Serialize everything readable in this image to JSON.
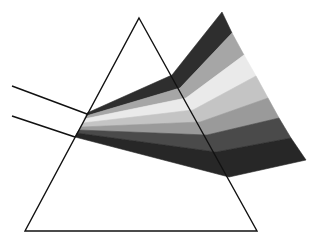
{
  "diagram": {
    "background": "#ffffff",
    "line_color": "#111111",
    "prism": {
      "apex": [
        139,
        18
      ],
      "bottom_left": [
        25,
        231
      ],
      "bottom_right": [
        257,
        231
      ]
    },
    "incoming_rays": [
      {
        "from": [
          12,
          86
        ],
        "to": [
          87,
          114
        ]
      },
      {
        "from": [
          12,
          116
        ],
        "to": [
          75,
          137
        ]
      }
    ],
    "bands": [
      {
        "color": "#2e2e2e",
        "entry": [
          [
            87,
            113
          ],
          [
            86,
            116
          ]
        ],
        "exit": [
          [
            172,
            75
          ],
          [
            180,
            88
          ]
        ],
        "out": [
          [
            222,
            12
          ],
          [
            232,
            33
          ]
        ]
      },
      {
        "color": "#a6a6a6",
        "entry": [
          [
            86,
            116
          ],
          [
            84,
            119
          ]
        ],
        "exit": [
          [
            180,
            88
          ],
          [
            186,
            98
          ]
        ],
        "out": [
          [
            232,
            33
          ],
          [
            244,
            55
          ]
        ]
      },
      {
        "color": "#eaeaea",
        "entry": [
          [
            84,
            119
          ],
          [
            83,
            123
          ]
        ],
        "exit": [
          [
            186,
            98
          ],
          [
            193,
            110
          ]
        ],
        "out": [
          [
            244,
            55
          ],
          [
            256,
            76
          ]
        ]
      },
      {
        "color": "#c4c4c4",
        "entry": [
          [
            83,
            123
          ],
          [
            81,
            127
          ]
        ],
        "exit": [
          [
            193,
            110
          ],
          [
            200,
            122
          ]
        ],
        "out": [
          [
            256,
            76
          ],
          [
            268,
            98
          ]
        ]
      },
      {
        "color": "#9a9a9a",
        "entry": [
          [
            81,
            127
          ],
          [
            79,
            130
          ]
        ],
        "exit": [
          [
            200,
            122
          ],
          [
            207,
            135
          ]
        ],
        "out": [
          [
            268,
            98
          ],
          [
            279,
            118
          ]
        ]
      },
      {
        "color": "#4a4a4a",
        "entry": [
          [
            79,
            130
          ],
          [
            77,
            133
          ]
        ],
        "exit": [
          [
            207,
            135
          ],
          [
            216,
            152
          ]
        ],
        "out": [
          [
            279,
            118
          ],
          [
            291,
            138
          ]
        ]
      },
      {
        "color": "#272727",
        "entry": [
          [
            77,
            133
          ],
          [
            75,
            137
          ]
        ],
        "exit": [
          [
            216,
            152
          ],
          [
            229,
            177
          ]
        ],
        "out": [
          [
            291,
            138
          ],
          [
            306,
            160
          ]
        ]
      }
    ]
  }
}
